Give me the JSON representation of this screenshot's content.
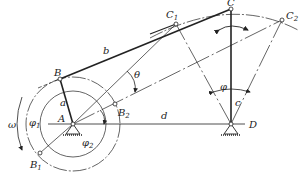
{
  "diagram": {
    "type": "four-bar crank-rocker mechanism (extreme positions)",
    "colors": {
      "ink": "#222222",
      "background": "#ffffff"
    },
    "points": {
      "A": {
        "label": "A",
        "x": 73,
        "y": 124
      },
      "B": {
        "label": "B",
        "x": 60,
        "y": 79
      },
      "B1": {
        "label": "B",
        "sub": "1",
        "x": 40,
        "y": 153
      },
      "B2": {
        "label": "B",
        "sub": "2",
        "x": 115,
        "y": 104
      },
      "C": {
        "label": "C",
        "x": 231,
        "y": 9
      },
      "C1": {
        "label": "C",
        "sub": "1",
        "x": 176,
        "y": 24
      },
      "C2": {
        "label": "C",
        "sub": "2",
        "x": 282,
        "y": 20
      },
      "D": {
        "label": "D",
        "x": 231,
        "y": 124
      }
    },
    "links": {
      "a": "a",
      "b": "b",
      "c": "c",
      "d": "d"
    },
    "angles": {
      "theta": "θ",
      "phi": "φ",
      "phi1": "φ",
      "phi1_sub": "1",
      "phi2": "φ",
      "phi2_sub": "2",
      "omega": "ω"
    }
  }
}
